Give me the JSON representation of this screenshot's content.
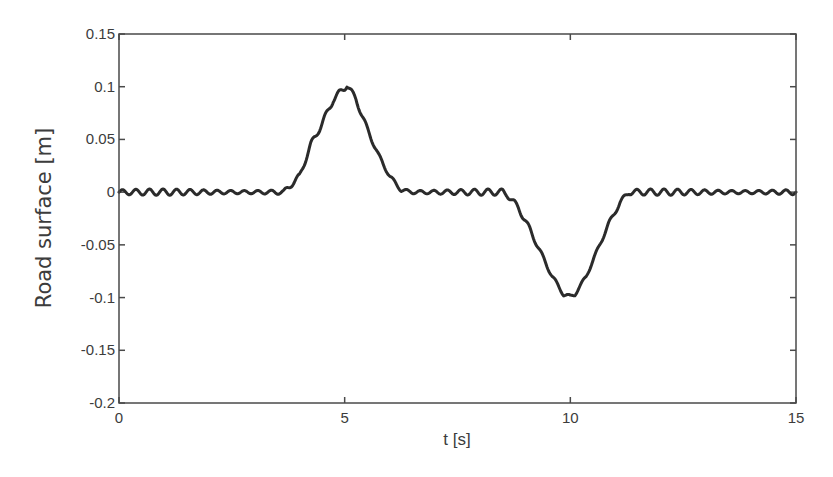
{
  "chart_data": {
    "type": "line",
    "title": "",
    "xlabel": "t [s]",
    "ylabel": "Road surface [m]",
    "xlim": [
      0,
      15
    ],
    "ylim": [
      -0.2,
      0.15
    ],
    "grid": false,
    "legend": null,
    "x_ticks": [
      0,
      5,
      10,
      15
    ],
    "x_tick_labels": [
      "0",
      "5",
      "10",
      "15"
    ],
    "y_ticks": [
      0.15,
      0.1,
      0.05,
      0,
      -0.05,
      -0.1,
      -0.15,
      -0.2
    ],
    "y_tick_labels": [
      "0.15",
      "0.1",
      "0.05",
      "0",
      "-0.05",
      "-0.1",
      "-0.15",
      "-0.2"
    ],
    "series": [
      {
        "name": "Road surface",
        "color": "#2b2b2b",
        "description": "Flat road with small ripple (~±0.003 m), a triangular-ish bump peaking at ~0.1 m near t=5 s, and a dip reaching ~-0.1 m near t=10 s",
        "x": [
          0,
          0.5,
          1,
          1.5,
          2,
          2.5,
          3,
          3.5,
          3.65,
          4.0,
          4.25,
          4.5,
          4.75,
          5.0,
          5.05,
          5.25,
          5.5,
          5.75,
          6.0,
          6.25,
          6.5,
          7,
          7.5,
          8,
          8.5,
          8.6,
          8.85,
          9.1,
          9.35,
          9.6,
          9.85,
          10.0,
          10.1,
          10.35,
          10.6,
          10.85,
          11.1,
          11.3,
          11.5,
          12,
          12.5,
          13,
          13.5,
          14,
          14.5,
          15
        ],
        "y": [
          0,
          0,
          0,
          0,
          0,
          0,
          0,
          0,
          0,
          0.015,
          0.045,
          0.065,
          0.088,
          0.099,
          0.102,
          0.088,
          0.06,
          0.035,
          0.015,
          0.002,
          0,
          0,
          0,
          0,
          0,
          -0.002,
          -0.015,
          -0.035,
          -0.058,
          -0.08,
          -0.097,
          -0.099,
          -0.097,
          -0.08,
          -0.055,
          -0.03,
          -0.01,
          0,
          0,
          0,
          0,
          0,
          0,
          0,
          0,
          0
        ],
        "ripple_amplitude": 0.003,
        "ripple_period_s": 0.3
      }
    ]
  }
}
